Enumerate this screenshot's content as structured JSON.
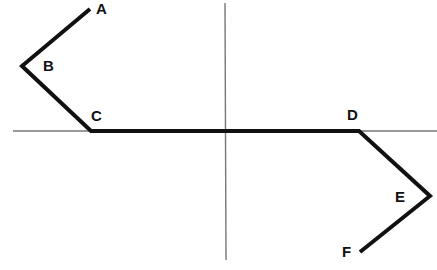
{
  "diagram": {
    "axes": {
      "horizontal": {
        "x1": 13,
        "y1": 131,
        "x2": 437,
        "y2": 131,
        "color": "#777777"
      },
      "vertical": {
        "x1": 225,
        "y1": 3,
        "x2": 226,
        "y2": 260,
        "color": "#777777"
      }
    },
    "path": {
      "color": "#111111",
      "points": [
        {
          "label": "A",
          "x": 90,
          "y": 9,
          "label_x": 96,
          "label_y": 14
        },
        {
          "label": "B",
          "x": 22,
          "y": 66,
          "label_x": 43,
          "label_y": 71
        },
        {
          "label": "C",
          "x": 91,
          "y": 131,
          "label_x": 91,
          "label_y": 121
        },
        {
          "label": "D",
          "x": 359,
          "y": 131,
          "label_x": 347,
          "label_y": 120
        },
        {
          "label": "E",
          "x": 430,
          "y": 196,
          "label_x": 395,
          "label_y": 202
        },
        {
          "label": "F",
          "x": 360,
          "y": 252,
          "label_x": 342,
          "label_y": 257
        }
      ]
    }
  }
}
